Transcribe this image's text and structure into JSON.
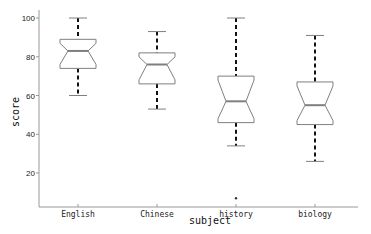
{
  "chart_data": {
    "type": "boxplot",
    "title": "",
    "xlabel": "subject",
    "ylabel": "score",
    "categories": [
      "English",
      "Chinese",
      "history",
      "biology"
    ],
    "yticks": [
      20,
      40,
      60,
      80,
      100
    ],
    "ylim": [
      2,
      102
    ],
    "grid": false,
    "notched": true,
    "series": [
      {
        "name": "English",
        "whisker_low": 60,
        "q1": 74,
        "median": 83,
        "q3": 89,
        "whisker_high": 100,
        "outliers": []
      },
      {
        "name": "Chinese",
        "whisker_low": 53,
        "q1": 66,
        "median": 76,
        "q3": 82,
        "whisker_high": 93,
        "outliers": []
      },
      {
        "name": "history",
        "whisker_low": 34,
        "q1": 46,
        "median": 57,
        "q3": 70,
        "whisker_high": 100,
        "outliers": [
          7
        ]
      },
      {
        "name": "biology",
        "whisker_low": 26,
        "q1": 45,
        "median": 55,
        "q3": 67,
        "whisker_high": 91,
        "outliers": []
      }
    ]
  },
  "colors": {
    "box_edge": "#7f7f7f",
    "whisker": "#111111",
    "axis": "#999999"
  }
}
